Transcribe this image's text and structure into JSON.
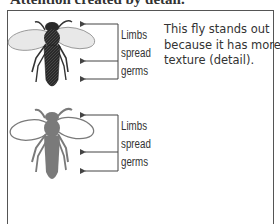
{
  "heading": "Attention created by detail.",
  "figure_top": {
    "style": "detailed-textured",
    "callout_lines": [
      "Limbs",
      "spread",
      "germs"
    ],
    "arrow_y": [
      24,
      61,
      79
    ],
    "colors": {
      "body": "#2a2a2a",
      "wing": "#e6e6e6",
      "wing_stroke": "#8a8a8a"
    }
  },
  "figure_bottom": {
    "style": "flat-silhouette",
    "callout_lines": [
      "Limbs",
      "spread",
      "germs"
    ],
    "arrow_y": [
      115,
      152,
      171
    ],
    "colors": {
      "body": "#7a7a7a",
      "wing": "#ffffff",
      "wing_stroke": "#7a7a7a"
    }
  },
  "caption_lines": [
    "This fly stands out",
    "because it has more",
    "texture (detail)."
  ],
  "colors": {
    "frame": "#555555",
    "text": "#333333",
    "arrow": "#444444"
  }
}
